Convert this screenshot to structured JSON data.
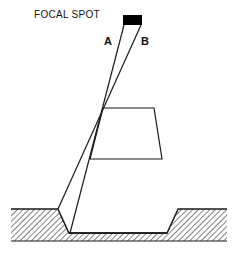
{
  "diagram": {
    "title_label": "FOCAL SPOT",
    "ray_labels": {
      "a": "A",
      "b": "B"
    },
    "colors": {
      "stroke": "#1a1a1a",
      "focal_spot_fill": "#000000",
      "background": "#ffffff"
    },
    "elements": {
      "focal_spot": "Small black rectangular X-ray source at top",
      "ray_a": "Ray from left edge of focal spot",
      "ray_b": "Ray from right edge of focal spot",
      "object": "Trapezoidal object in beam path",
      "ground": "Hatched ground/film surface with recessed pit"
    }
  }
}
